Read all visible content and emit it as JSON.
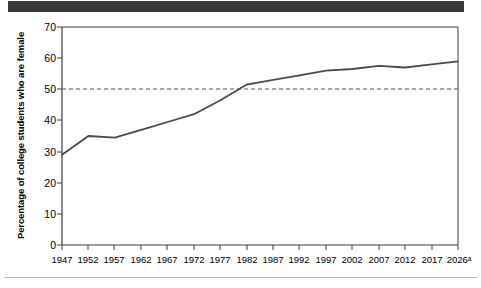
{
  "header": {
    "bar_color": "#3a3a3a"
  },
  "footer": {
    "rule_color": "#b9b9b9"
  },
  "chart_data": {
    "type": "line",
    "title": "",
    "xlabel": "",
    "ylabel": "Percentage of college students who are female",
    "x": [
      "1947",
      "1952",
      "1957",
      "1962",
      "1967",
      "1972",
      "1977",
      "1982",
      "1987",
      "1992",
      "1997",
      "2002",
      "2007",
      "2012",
      "2017",
      "2026ᵃ"
    ],
    "x_numeric": [
      1947,
      1952,
      1957,
      1962,
      1967,
      1972,
      1977,
      1982,
      1987,
      1992,
      1997,
      2002,
      2007,
      2012,
      2017,
      2026
    ],
    "values": [
      29,
      35,
      34.5,
      37,
      39.5,
      42,
      46.5,
      51.5,
      53,
      54.5,
      56,
      56.5,
      57.5,
      57,
      58,
      59
    ],
    "series": [
      {
        "name": "Percentage of college students who are female",
        "values": [
          29,
          35,
          34.5,
          37,
          39.5,
          42,
          46.5,
          51.5,
          53,
          54.5,
          56,
          56.5,
          57.5,
          57,
          58,
          59
        ],
        "color": "#4a4a4a"
      }
    ],
    "ylim": [
      0,
      70
    ],
    "yticks": [
      0,
      10,
      20,
      30,
      40,
      50,
      60,
      70
    ],
    "ytick_labels": [
      "0",
      "10",
      "20",
      "30",
      "40",
      "50",
      "60",
      "70"
    ],
    "grid": false,
    "legend": "none",
    "reference_line": {
      "value": 50,
      "style": "dashed",
      "color": "#555555",
      "label": ""
    },
    "footnote_marker": "a"
  }
}
